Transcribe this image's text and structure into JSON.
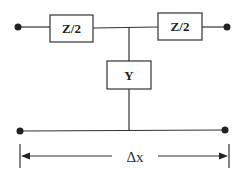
{
  "diagram": {
    "type": "T-network equivalent circuit",
    "components": [
      {
        "id": "series-left",
        "label": "Z/2"
      },
      {
        "id": "series-right",
        "label": "Z/2"
      },
      {
        "id": "shunt",
        "label": "Y"
      }
    ],
    "dimension_label": "Δx",
    "terminals": 4,
    "colors": {
      "line": "#333333",
      "background": "#ffffff"
    }
  }
}
